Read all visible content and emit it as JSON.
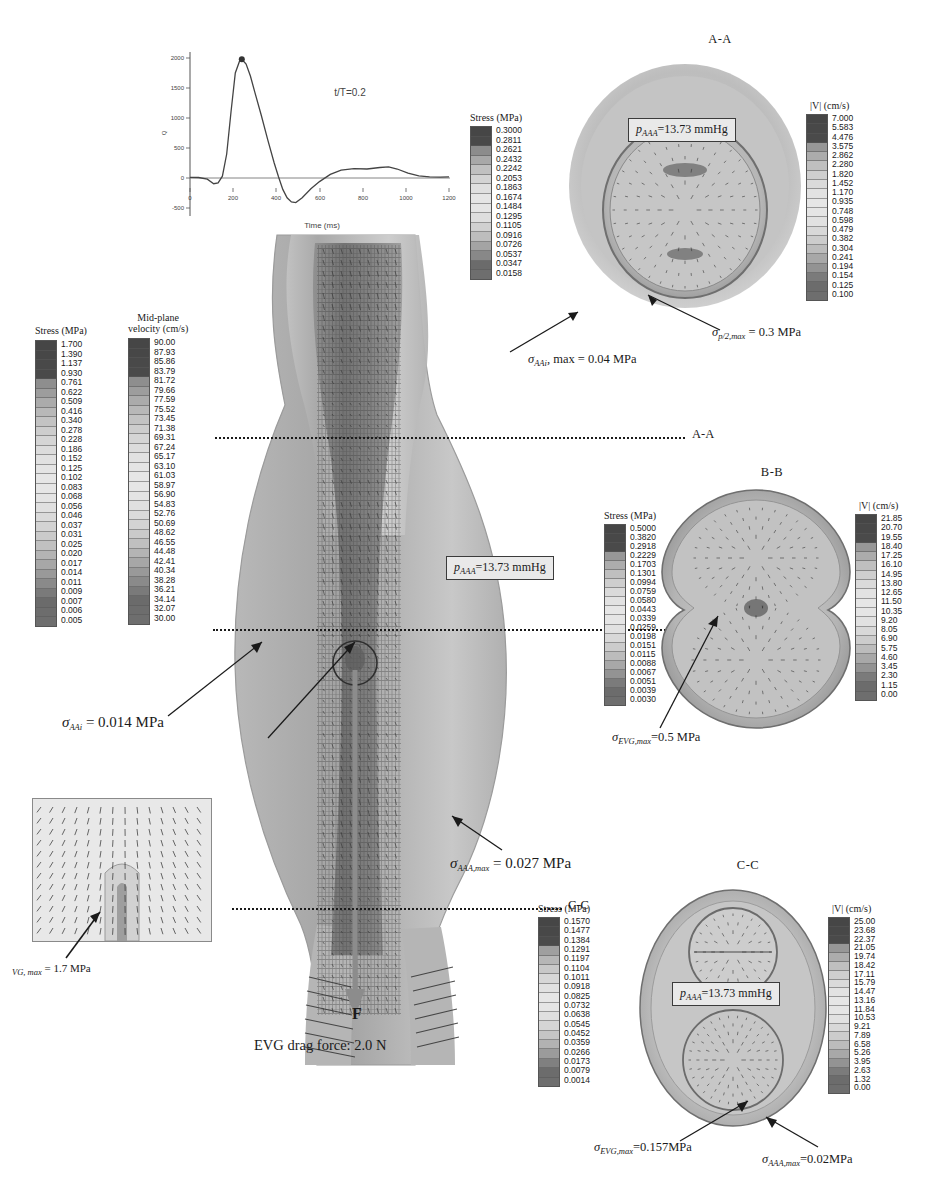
{
  "figure": {
    "title_hidden": "",
    "section_labels": {
      "aa": "A-A",
      "bb": "B-B",
      "cc": "C-C"
    },
    "cut_lines": {
      "aa": "A-A",
      "bb": "B-B",
      "cc": "C-C"
    }
  },
  "waveform": {
    "annotation": "t/T=0.2",
    "xlabel": "Time (ms)",
    "ylabel": "Q",
    "xticks": [
      "0",
      "200",
      "400",
      "600",
      "800",
      "1000",
      "1200"
    ],
    "yticks": [
      "2000",
      "1500",
      "1000",
      "500",
      "0",
      "-500"
    ]
  },
  "chart_data": {
    "type": "line",
    "title": "t/T=0.2",
    "xlabel": "Time (ms)",
    "ylabel": "Q",
    "xlim": [
      0,
      1200
    ],
    "ylim": [
      -500,
      2000
    ],
    "xticks": [
      0,
      200,
      400,
      600,
      800,
      1000,
      1200
    ],
    "yticks": [
      -500,
      0,
      500,
      1000,
      1500,
      2000
    ],
    "grid": false,
    "legend": "none",
    "marker_point": {
      "x": 240,
      "y": 1980,
      "label": "t/T=0.2"
    },
    "x": [
      0,
      40,
      80,
      110,
      130,
      150,
      170,
      190,
      210,
      230,
      240,
      260,
      280,
      300,
      330,
      360,
      390,
      410,
      430,
      450,
      470,
      490,
      520,
      560,
      600,
      650,
      700,
      760,
      820,
      880,
      920,
      960,
      1010,
      1060,
      1110,
      1160,
      1200
    ],
    "y": [
      10,
      8,
      -20,
      -95,
      -80,
      30,
      400,
      1100,
      1750,
      1950,
      1980,
      1900,
      1700,
      1430,
      1050,
      640,
      250,
      20,
      -190,
      -330,
      -400,
      -410,
      -330,
      -180,
      -60,
      60,
      130,
      155,
      150,
      175,
      185,
      150,
      80,
      35,
      20,
      15,
      18
    ]
  },
  "colorbars": {
    "midplane_stress": {
      "title": "Stress (MPa)",
      "values": [
        "1.700",
        "1.390",
        "1.137",
        "0.930",
        "0.761",
        "0.622",
        "0.509",
        "0.416",
        "0.340",
        "0.278",
        "0.228",
        "0.186",
        "0.152",
        "0.125",
        "0.102",
        "0.083",
        "0.068",
        "0.056",
        "0.046",
        "0.037",
        "0.031",
        "0.025",
        "0.020",
        "0.017",
        "0.014",
        "0.011",
        "0.009",
        "0.007",
        "0.006",
        "0.005"
      ]
    },
    "midplane_velocity": {
      "title_line1": "Mid-plane",
      "title_line2": "velocity (cm/s)",
      "values": [
        "90.00",
        "87.93",
        "85.86",
        "83.79",
        "81.72",
        "79.66",
        "77.59",
        "75.52",
        "73.45",
        "71.38",
        "69.31",
        "67.24",
        "65.17",
        "63.10",
        "61.03",
        "58.97",
        "56.90",
        "54.83",
        "52.76",
        "50.69",
        "48.62",
        "46.55",
        "44.48",
        "42.41",
        "40.34",
        "38.28",
        "36.21",
        "34.14",
        "32.07",
        "30.00"
      ]
    },
    "aa_stress": {
      "title": "Stress (MPa)",
      "values": [
        "0.3000",
        "0.2811",
        "0.2621",
        "0.2432",
        "0.2242",
        "0.2053",
        "0.1863",
        "0.1674",
        "0.1484",
        "0.1295",
        "0.1105",
        "0.0916",
        "0.0726",
        "0.0537",
        "0.0347",
        "0.0158"
      ]
    },
    "aa_velocity": {
      "title": "|V| (cm/s)",
      "values": [
        "7.000",
        "5.583",
        "4.476",
        "3.575",
        "2.862",
        "2.280",
        "1.820",
        "1.452",
        "1.170",
        "0.935",
        "0.748",
        "0.598",
        "0.479",
        "0.382",
        "0.304",
        "0.241",
        "0.194",
        "0.154",
        "0.125",
        "0.100"
      ]
    },
    "bb_stress": {
      "title": "Stress (MPa)",
      "values": [
        "0.5000",
        "0.3820",
        "0.2918",
        "0.2229",
        "0.1703",
        "0.1301",
        "0.0994",
        "0.0759",
        "0.0580",
        "0.0443",
        "0.0339",
        "0.0259",
        "0.0198",
        "0.0151",
        "0.0115",
        "0.0088",
        "0.0067",
        "0.0051",
        "0.0039",
        "0.0030"
      ]
    },
    "bb_velocity": {
      "title": "|V| (cm/s)",
      "values": [
        "21.85",
        "20.70",
        "19.55",
        "18.40",
        "17.25",
        "16.10",
        "14.95",
        "13.80",
        "12.65",
        "11.50",
        "10.35",
        "9.20",
        "8.05",
        "6.90",
        "5.75",
        "4.60",
        "3.45",
        "2.30",
        "1.15",
        "0.00"
      ]
    },
    "cc_stress": {
      "title": "Stress (MPa)",
      "values": [
        "0.1570",
        "0.1477",
        "0.1384",
        "0.1291",
        "0.1197",
        "0.1104",
        "0.1011",
        "0.0918",
        "0.0825",
        "0.0732",
        "0.0638",
        "0.0545",
        "0.0452",
        "0.0359",
        "0.0266",
        "0.0173",
        "0.0079",
        "0.0014"
      ]
    },
    "cc_velocity": {
      "title": "|V| (cm/s)",
      "values": [
        "25.00",
        "23.68",
        "22.37",
        "21.05",
        "19.74",
        "18.42",
        "17.11",
        "15.79",
        "14.47",
        "13.16",
        "11.84",
        "10.53",
        "9.21",
        "7.89",
        "6.58",
        "5.26",
        "3.95",
        "2.63",
        "1.32",
        "0.00"
      ]
    }
  },
  "pressure_boxes": {
    "aa": "p_AAA=13.73 mmHg",
    "mid": "p_AAA=13.73 mmHg",
    "cc": "p_AAA=13.73 mmHg",
    "symbol": "p",
    "sub": "AAA",
    "value": "=13.73 mmHg"
  },
  "annotations": {
    "aa_inner": {
      "sym": "σ",
      "sub": "AAi",
      "rest": ", max = 0.04 MPa"
    },
    "aa_prox": {
      "sym": "σ",
      "sub": "p/2,max",
      "rest": " = 0.3 MPa"
    },
    "mid_aai": {
      "sym": "σ",
      "sub": "AAi",
      "rest": " = 0.014 MPa"
    },
    "mid_aaa_max": {
      "sym": "σ",
      "sub": "AAA,max",
      "rest": " = 0.027 MPa"
    },
    "inset_evg": {
      "sym": "",
      "sub": "VG, max",
      "rest": " = 1.7 MPa"
    },
    "bb_evg": {
      "sym": "σ",
      "sub": "EVG,max",
      "rest": "=0.5 MPa"
    },
    "cc_evg": {
      "sym": "σ",
      "sub": "EVG,max",
      "rest": "=0.157MPa"
    },
    "cc_aaa": {
      "sym": "σ",
      "sub": "AAA,max",
      "rest": "=0.02MPa"
    },
    "force_label": "F",
    "force_text": "EVG drag force: 2.0 N"
  },
  "palette": {
    "dark": "#4a4a4a",
    "mid": "#9a9a9a",
    "light": "#d8d8d8",
    "vessel_outer": "#cfcfcf",
    "vessel_inner": "#a8a8a8",
    "line": "#1a1a1a"
  }
}
